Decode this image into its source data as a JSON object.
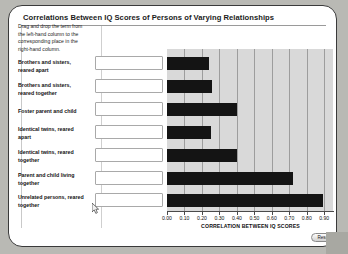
{
  "app": {
    "title": "Correlations Between IQ Scores of Persons of Varying Relationships",
    "instructions": "Drag and drop the term from the left-hand column to the corresponding place in the right-hand column.",
    "reset_label": "Reset",
    "cursor_icon": "arrow-cursor-icon"
  },
  "rows": [
    {
      "label": "Brothers and sisters, reared apart"
    },
    {
      "label": "Brothers and sisters, reared together"
    },
    {
      "label": "Foster parent and child"
    },
    {
      "label": "Identical twins, reared apart"
    },
    {
      "label": "Identical twins, reared together"
    },
    {
      "label": "Parent and child living together"
    },
    {
      "label": "Unrelated persons, reared together"
    }
  ],
  "drop_boxes": [
    {
      "value": "",
      "placeholder": ""
    },
    {
      "value": "",
      "placeholder": ""
    },
    {
      "value": "",
      "placeholder": ""
    },
    {
      "value": "",
      "placeholder": ""
    },
    {
      "value": "",
      "placeholder": ""
    },
    {
      "value": "",
      "placeholder": ""
    },
    {
      "value": "",
      "placeholder": ""
    }
  ],
  "colors": {
    "bar": "#141414",
    "plot_background": "#d9d9d9",
    "gridline": "#9d9d9d",
    "card": "#ffffff",
    "page_background": "#b9b9b4"
  },
  "chart_data": {
    "type": "bar",
    "orientation": "horizontal",
    "title": "Correlations Between IQ Scores of Persons of Varying Relationships",
    "xlabel": "CORRELATION BETWEEN IQ SCORES",
    "ylabel": "",
    "xlim": [
      0.0,
      0.95
    ],
    "grid": true,
    "legend": "none",
    "categories": [
      "Brothers and sisters, reared apart",
      "Brothers and sisters, reared together",
      "Foster parent and child",
      "Identical twins, reared apart",
      "Identical twins, reared together",
      "Parent and child living together",
      "Unrelated persons, reared together"
    ],
    "values": [
      0.24,
      0.26,
      0.4,
      0.25,
      0.4,
      0.72,
      0.89
    ],
    "tick_labels": [
      "0.00",
      "0.10",
      "0.20",
      "0.30",
      "0.40",
      "0.50",
      "0.60",
      "0.70",
      "0.80",
      "0.90"
    ],
    "tick_values": [
      0.0,
      0.1,
      0.2,
      0.3,
      0.4,
      0.5,
      0.6,
      0.7,
      0.8,
      0.9
    ]
  }
}
